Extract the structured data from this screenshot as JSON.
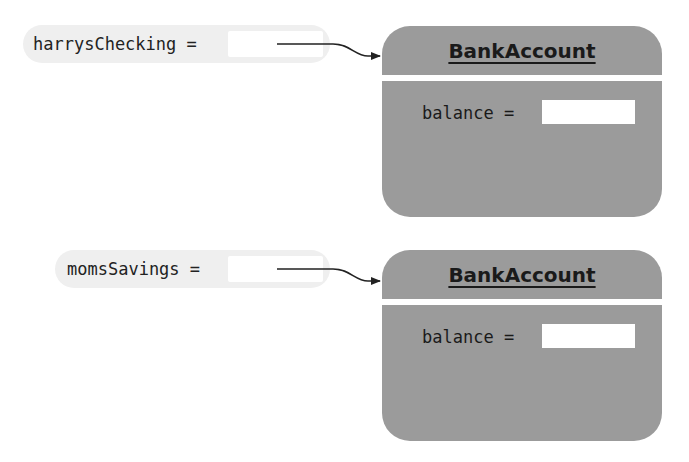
{
  "diagram": {
    "type": "object-reference-diagram",
    "colors": {
      "object_fill": "#9b9b9b",
      "variable_pill_fill": "#efefef",
      "slot_fill": "#ffffff",
      "arrow": "#222222"
    },
    "variables": [
      {
        "label": "harrysChecking =",
        "points_to": "object-1"
      },
      {
        "label": "momsSavings =",
        "points_to": "object-2"
      }
    ],
    "objects": [
      {
        "class_name": "BankAccount",
        "fields": [
          {
            "label": "balance =",
            "value": ""
          }
        ]
      },
      {
        "class_name": "BankAccount",
        "fields": [
          {
            "label": "balance =",
            "value": ""
          }
        ]
      }
    ]
  }
}
